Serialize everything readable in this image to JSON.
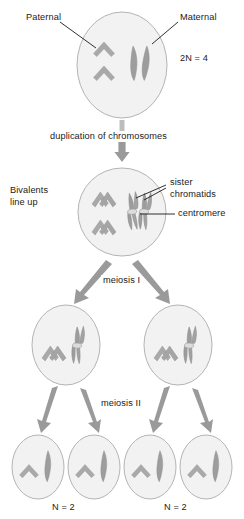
{
  "figure": {
    "background_color": "#ffffff",
    "ink_color": "#1a1a1a"
  },
  "palette": {
    "cell_fill": "#f2f2f2",
    "cell_stroke": "#b4b4b4",
    "paternal_chromosome": "#a9a9a9",
    "maternal_chromosome": "#9d9d9d",
    "chromatid_outline": "#8a8a8a",
    "centromere": "#d8d8d8",
    "arrow_fill": "#9a9a9a",
    "leader_line": "#1a1a1a",
    "text": "#1a1a1a"
  },
  "labels": {
    "paternal": "Paternal",
    "maternal": "Maternal",
    "ploidy_diploid": "2N = 4",
    "duplication": "duplication of chromosomes",
    "bivalents_line1": "Bivalents",
    "bivalents_line2": "line up",
    "sister_line1": "sister",
    "sister_line2": "chromatids",
    "centromere": "centromere",
    "meiosis_one": "meiosis I",
    "meiosis_two": "meiosis II",
    "ploidy_haploid_left": "N = 2",
    "ploidy_haploid_right": "N = 2"
  },
  "stages": [
    {
      "id": "parent-cell",
      "name": "parent-diploid-cell",
      "ploidy": "2N = 4",
      "chromosomes": [
        {
          "type": "chevron",
          "origin": "paternal",
          "duplicated": false
        },
        {
          "type": "chevron",
          "origin": "paternal",
          "duplicated": false
        },
        {
          "type": "rod",
          "origin": "maternal",
          "duplicated": false
        },
        {
          "type": "rod",
          "origin": "maternal",
          "duplicated": false
        }
      ]
    },
    {
      "id": "bivalent-cell",
      "name": "cell-after-duplication",
      "ploidy": "",
      "chromosomes": [
        {
          "type": "chevron",
          "origin": "paternal",
          "duplicated": true
        },
        {
          "type": "chevron",
          "origin": "paternal",
          "duplicated": true
        },
        {
          "type": "rod",
          "origin": "maternal",
          "duplicated": true
        },
        {
          "type": "rod",
          "origin": "maternal",
          "duplicated": true
        }
      ]
    },
    {
      "id": "daughter-cell-left",
      "name": "daughter-cell-after-meiosis-i-left",
      "ploidy": "",
      "chromosomes": [
        {
          "type": "chevron",
          "origin": "paternal",
          "duplicated": true
        },
        {
          "type": "rod",
          "origin": "maternal",
          "duplicated": true
        }
      ]
    },
    {
      "id": "daughter-cell-right",
      "name": "daughter-cell-after-meiosis-i-right",
      "ploidy": "",
      "chromosomes": [
        {
          "type": "chevron",
          "origin": "paternal",
          "duplicated": true
        },
        {
          "type": "rod",
          "origin": "maternal",
          "duplicated": true
        }
      ]
    },
    {
      "id": "gamete-1",
      "name": "gamete-cell-1",
      "ploidy": "N = 2",
      "chromosomes": [
        {
          "type": "chevron",
          "origin": "paternal",
          "duplicated": false
        },
        {
          "type": "rod",
          "origin": "maternal",
          "duplicated": false
        }
      ]
    },
    {
      "id": "gamete-2",
      "name": "gamete-cell-2",
      "ploidy": "N = 2",
      "chromosomes": [
        {
          "type": "chevron",
          "origin": "paternal",
          "duplicated": false
        },
        {
          "type": "rod",
          "origin": "maternal",
          "duplicated": false
        }
      ]
    },
    {
      "id": "gamete-3",
      "name": "gamete-cell-3",
      "ploidy": "N = 2",
      "chromosomes": [
        {
          "type": "chevron",
          "origin": "paternal",
          "duplicated": false
        },
        {
          "type": "rod",
          "origin": "maternal",
          "duplicated": false
        }
      ]
    },
    {
      "id": "gamete-4",
      "name": "gamete-cell-4",
      "ploidy": "N = 2",
      "chromosomes": [
        {
          "type": "chevron",
          "origin": "paternal",
          "duplicated": false
        },
        {
          "type": "rod",
          "origin": "maternal",
          "duplicated": false
        }
      ]
    }
  ]
}
